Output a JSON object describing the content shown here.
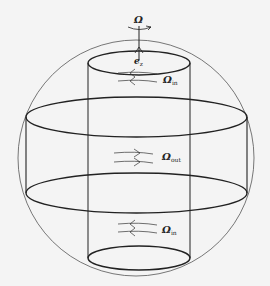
{
  "diagram": {
    "colors": {
      "background": "#f4f4f4",
      "stroke": "#222222",
      "sphere": "#555555"
    },
    "labels": {
      "omega": "Ω",
      "ez": "e",
      "ez_sub": "z",
      "omega_in_top": "Ω",
      "omega_in_top_sub": "in",
      "omega_out": "Ω",
      "omega_out_sub": "out",
      "omega_in_bottom": "Ω",
      "omega_in_bottom_sub": "in"
    },
    "flow_arrows": [
      {
        "region": "inner-top",
        "direction": "left"
      },
      {
        "region": "outer-middle",
        "direction": "right"
      },
      {
        "region": "inner-bottom",
        "direction": "left"
      }
    ]
  }
}
